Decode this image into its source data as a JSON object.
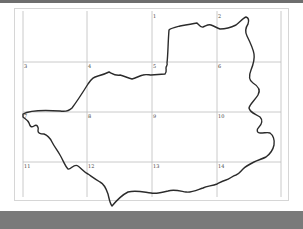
{
  "map": {
    "type": "grid-outline-sketch",
    "colors": {
      "background": "#ffffff",
      "grid_line": "#bdbdbd",
      "outline": "#2b2b2b",
      "top_bar": "#6e6e6e",
      "bottom_bar": "#7a7a7a",
      "paper_border": "#d6d6d6"
    },
    "grid": {
      "columns": 4,
      "rows": 4,
      "cells": [
        {
          "label": "",
          "row": 0,
          "col": 0
        },
        {
          "label": "",
          "row": 0,
          "col": 1
        },
        {
          "label": "1",
          "row": 0,
          "col": 2
        },
        {
          "label": "2",
          "row": 0,
          "col": 3
        },
        {
          "label": "3",
          "row": 1,
          "col": 0
        },
        {
          "label": "4",
          "row": 1,
          "col": 1
        },
        {
          "label": "5",
          "row": 1,
          "col": 2
        },
        {
          "label": "6",
          "row": 1,
          "col": 3
        },
        {
          "label": "7",
          "row": 2,
          "col": 0
        },
        {
          "label": "8",
          "row": 2,
          "col": 1
        },
        {
          "label": "9",
          "row": 2,
          "col": 2
        },
        {
          "label": "10",
          "row": 2,
          "col": 3
        },
        {
          "label": "11",
          "row": 3,
          "col": 0
        },
        {
          "label": "12",
          "row": 3,
          "col": 1
        },
        {
          "label": "13",
          "row": 3,
          "col": 2
        },
        {
          "label": "14",
          "row": 3,
          "col": 3
        }
      ]
    }
  }
}
